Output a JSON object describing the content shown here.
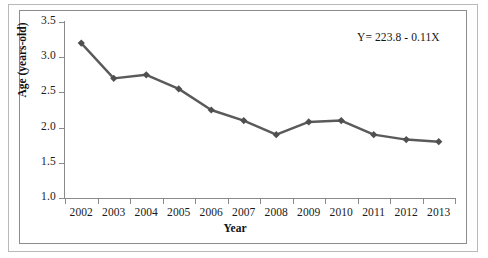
{
  "chart_data": {
    "type": "line",
    "title": "",
    "xlabel": "Year",
    "ylabel": "Age (years-old)",
    "categories": [
      "2002",
      "2003",
      "2004",
      "2005",
      "2006",
      "2007",
      "2008",
      "2009",
      "2010",
      "2011",
      "2012",
      "2013"
    ],
    "values": [
      3.2,
      2.7,
      2.75,
      2.55,
      2.25,
      2.1,
      1.9,
      2.08,
      2.1,
      1.9,
      1.83,
      1.8
    ],
    "series": [
      {
        "name": "Age",
        "values": [
          3.2,
          2.7,
          2.75,
          2.55,
          2.25,
          2.1,
          1.9,
          2.08,
          2.1,
          1.9,
          1.83,
          1.8
        ]
      }
    ],
    "ylim": [
      1.0,
      3.5
    ],
    "ytick_labels": [
      "1.0",
      "1.5",
      "2.0",
      "2.5",
      "3.0",
      "3.5"
    ],
    "ytick_values": [
      1.0,
      1.5,
      2.0,
      2.5,
      3.0,
      3.5
    ],
    "xtick_labels": [
      "2002",
      "2003",
      "2004",
      "2005",
      "2006",
      "2007",
      "2008",
      "2009",
      "2010",
      "2011",
      "2012",
      "2013"
    ],
    "grid": false,
    "legend": "none",
    "marker": "diamond",
    "annotations": [
      {
        "name": "regression-equation",
        "text": "Y= 223.8 - 0.11X"
      }
    ],
    "colors": {
      "series_line": "#5a5a5a",
      "marker": "#4f4f4f",
      "axis": "#8a8a8a",
      "text": "#1a1a1a",
      "plot_border": "#8c8c8c",
      "outer_border": "#b9b9b9",
      "background": "#ffffff"
    }
  },
  "axes": {
    "y_title": "Age (years-old)",
    "x_title": "Year"
  },
  "annotation": {
    "equation": "Y= 223.8 - 0.11X"
  }
}
